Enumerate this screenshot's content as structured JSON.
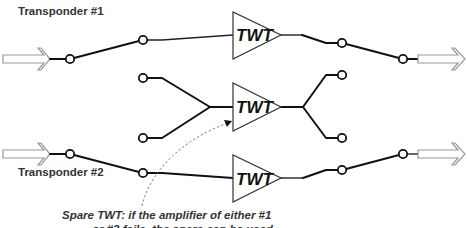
{
  "diagram": {
    "labels": {
      "transponder1": "Transponder #1",
      "transponder2": "Transponder #2"
    },
    "amplifiers": [
      {
        "id": "twt-top",
        "label": "TWT"
      },
      {
        "id": "twt-spare",
        "label": "TWT"
      },
      {
        "id": "twt-bottom",
        "label": "TWT"
      }
    ],
    "caption": {
      "line1": "Spare TWT: if the amplifier of either #1",
      "line2": "or #2 fails, the spare can be used"
    }
  }
}
